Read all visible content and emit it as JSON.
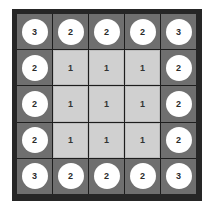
{
  "board": {
    "rows": 5,
    "cols": 5,
    "colors": {
      "frame": "#262626",
      "outer_cell": "#6f6f6f",
      "inner_cell": "#d0d0d0",
      "disc": "#ffffff",
      "text": "#2b2b2b"
    },
    "cells": [
      [
        {
          "value": "3",
          "type": "outer"
        },
        {
          "value": "2",
          "type": "outer"
        },
        {
          "value": "2",
          "type": "outer"
        },
        {
          "value": "2",
          "type": "outer"
        },
        {
          "value": "3",
          "type": "outer"
        }
      ],
      [
        {
          "value": "2",
          "type": "outer"
        },
        {
          "value": "1",
          "type": "inner"
        },
        {
          "value": "1",
          "type": "inner"
        },
        {
          "value": "1",
          "type": "inner"
        },
        {
          "value": "2",
          "type": "outer"
        }
      ],
      [
        {
          "value": "2",
          "type": "outer"
        },
        {
          "value": "1",
          "type": "inner"
        },
        {
          "value": "1",
          "type": "inner"
        },
        {
          "value": "1",
          "type": "inner"
        },
        {
          "value": "2",
          "type": "outer"
        }
      ],
      [
        {
          "value": "2",
          "type": "outer"
        },
        {
          "value": "1",
          "type": "inner"
        },
        {
          "value": "1",
          "type": "inner"
        },
        {
          "value": "1",
          "type": "inner"
        },
        {
          "value": "2",
          "type": "outer"
        }
      ],
      [
        {
          "value": "3",
          "type": "outer"
        },
        {
          "value": "2",
          "type": "outer"
        },
        {
          "value": "2",
          "type": "outer"
        },
        {
          "value": "2",
          "type": "outer"
        },
        {
          "value": "3",
          "type": "outer"
        }
      ]
    ]
  }
}
